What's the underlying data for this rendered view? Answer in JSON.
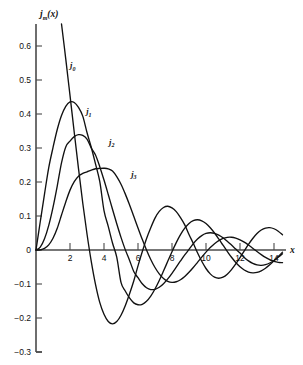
{
  "chart_data": {
    "type": "line",
    "title": "",
    "xlabel": "x",
    "ylabel": "j_m(x)",
    "ylabel_base": "j",
    "ylabel_sub": "m",
    "ylabel_arg": "(x)",
    "xlim": [
      0,
      14.6
    ],
    "ylim": [
      -0.3,
      0.62
    ],
    "grid": false,
    "legend_position": "inline-curve-labels",
    "x_ticks": [
      2,
      4,
      6,
      8,
      10,
      12,
      14
    ],
    "x_tick_labels": [
      "2",
      "4",
      "6",
      "8",
      "10",
      "12",
      "14"
    ],
    "y_ticks": [
      0.6,
      0.5,
      0.4,
      0.3,
      0.2,
      0.1,
      0,
      -0.1,
      -0.2,
      -0.3
    ],
    "y_tick_labels": [
      "0.6",
      "0.5",
      "0.4",
      "0.3",
      "0.2",
      "0.1",
      "0",
      "-0.1",
      "-0.2",
      "-0.3"
    ],
    "annotations": [
      {
        "text": "j0",
        "base": "j",
        "sub": "0",
        "x": 2.0,
        "y": 0.535
      },
      {
        "text": "j1",
        "base": "j",
        "sub": "1",
        "x": 2.95,
        "y": 0.4
      },
      {
        "text": "j2",
        "base": "j",
        "sub": "2",
        "x": 4.3,
        "y": 0.31
      },
      {
        "text": "j3",
        "base": "j",
        "sub": "3",
        "x": 5.6,
        "y": 0.215
      }
    ],
    "series": [
      {
        "name": "j0",
        "label": "j_0(x)",
        "description": "Spherical Bessel function of order 0, sin(x)/x",
        "x": [
          0.0,
          0.25,
          0.5,
          0.75,
          1.0,
          1.25,
          1.5,
          1.75,
          2.0,
          2.25,
          2.5,
          2.75,
          3.0,
          3.25,
          3.5,
          3.75,
          4.0,
          4.25,
          4.5,
          4.75,
          5.0,
          5.25,
          5.5,
          5.75,
          6.0,
          6.25,
          6.5,
          6.75,
          7.0,
          7.25,
          7.5,
          7.75,
          8.0,
          8.25,
          8.5,
          8.75,
          9.0,
          9.25,
          9.5,
          9.75,
          10.0,
          10.25,
          10.5,
          10.75,
          11.0,
          11.25,
          11.5,
          11.75,
          12.0,
          12.25,
          12.5,
          12.75,
          13.0,
          13.25,
          13.5,
          13.75,
          14.0,
          14.25,
          14.5
        ],
        "y": [
          1.0,
          0.9896,
          0.9589,
          0.9089,
          0.8415,
          0.7592,
          0.665,
          0.5623,
          0.4546,
          0.3457,
          0.2392,
          0.1382,
          0.047,
          -0.0334,
          -0.101,
          -0.1541,
          -0.1892,
          -0.2103,
          -0.2172,
          -0.2104,
          -0.1918,
          -0.1638,
          -0.1293,
          -0.0913,
          -0.0466,
          -0.0053,
          0.0331,
          0.0655,
          0.0939,
          0.1134,
          0.1251,
          0.1288,
          0.1237,
          0.1129,
          0.0953,
          0.074,
          0.0458,
          0.0196,
          -0.008,
          -0.0332,
          -0.0544,
          -0.0703,
          -0.08,
          -0.083,
          -0.08,
          -0.0711,
          -0.0576,
          -0.0408,
          -0.0222,
          -0.0026,
          0.0167,
          0.0339,
          0.0484,
          0.0588,
          0.0646,
          0.0658,
          0.0625,
          0.0553,
          0.0446
        ]
      },
      {
        "name": "j1",
        "label": "j_1(x)",
        "description": "Spherical Bessel function of order 1, sin(x)/x^2 - cos(x)/x",
        "peak_value": 0.435,
        "peak_x": 2.08,
        "x": [
          0.0,
          0.25,
          0.5,
          0.75,
          1.0,
          1.25,
          1.5,
          1.75,
          2.0,
          2.25,
          2.5,
          2.75,
          3.0,
          3.25,
          3.5,
          3.75,
          4.0,
          4.25,
          4.5,
          4.75,
          5.0,
          5.25,
          5.5,
          5.75,
          6.0,
          6.25,
          6.5,
          6.75,
          7.0,
          7.25,
          7.5,
          7.75,
          8.0,
          8.25,
          8.5,
          8.75,
          9.0,
          9.25,
          9.5,
          9.75,
          10.0,
          10.25,
          10.5,
          10.75,
          11.0,
          11.25,
          11.5,
          11.75,
          12.0,
          12.25,
          12.5,
          12.75,
          13.0,
          13.25,
          13.5,
          13.75,
          14.0,
          14.25,
          14.5
        ],
        "y": [
          0.0,
          0.0831,
          0.1646,
          0.2423,
          0.3012,
          0.3545,
          0.3957,
          0.4227,
          0.4354,
          0.4339,
          0.4194,
          0.3937,
          0.3457,
          0.3022,
          0.2531,
          0.2015,
          0.1161,
          0.0695,
          0.0207,
          -0.021,
          -0.0951,
          -0.1206,
          -0.1411,
          -0.1556,
          -0.161,
          -0.1596,
          -0.1507,
          -0.1354,
          -0.1146,
          -0.0896,
          -0.062,
          -0.0333,
          -0.0049,
          0.0217,
          0.0451,
          0.0641,
          0.0781,
          0.0864,
          0.0889,
          0.0858,
          0.0779,
          0.0655,
          0.0501,
          0.0326,
          0.0142,
          -0.0041,
          -0.0214,
          -0.0367,
          -0.0494,
          -0.0589,
          -0.0648,
          -0.0671,
          -0.066,
          -0.0613,
          -0.0536,
          -0.0437,
          -0.032,
          -0.0193,
          -0.0063
        ]
      },
      {
        "name": "j2",
        "label": "j_2(x)",
        "description": "Spherical Bessel function of order 2",
        "peak_value": 0.3001,
        "peak_x": 3.34,
        "x": [
          0.0,
          0.25,
          0.5,
          0.75,
          1.0,
          1.25,
          1.5,
          1.75,
          2.0,
          2.25,
          2.5,
          2.75,
          3.0,
          3.25,
          3.5,
          3.75,
          4.0,
          4.25,
          4.5,
          4.75,
          5.0,
          5.25,
          5.5,
          5.75,
          6.0,
          6.25,
          6.5,
          6.75,
          7.0,
          7.25,
          7.5,
          7.75,
          8.0,
          8.25,
          8.5,
          8.75,
          9.0,
          9.25,
          9.5,
          9.75,
          10.0,
          10.25,
          10.5,
          10.75,
          11.0,
          11.25,
          11.5,
          11.75,
          12.0,
          12.25,
          12.5,
          12.75,
          13.0,
          13.25,
          13.5,
          13.75,
          14.0,
          14.25,
          14.5
        ],
        "y": [
          0.0,
          0.0083,
          0.0329,
          0.0726,
          0.1254,
          0.1882,
          0.2563,
          0.3033,
          0.3204,
          0.3335,
          0.3392,
          0.337,
          0.3263,
          0.3001,
          0.2794,
          0.2451,
          0.2057,
          0.1633,
          0.1198,
          0.0772,
          0.0372,
          0.0011,
          -0.0298,
          -0.0631,
          -0.0816,
          -0.0994,
          -0.111,
          -0.1163,
          -0.1157,
          -0.1097,
          -0.0992,
          -0.0851,
          -0.0685,
          -0.0506,
          -0.0323,
          -0.0146,
          0.0016,
          0.0184,
          0.0322,
          0.0424,
          0.0486,
          0.0508,
          0.0491,
          0.044,
          0.036,
          0.0259,
          0.0145,
          0.0027,
          -0.009,
          -0.0217,
          -0.0321,
          -0.0395,
          -0.0439,
          -0.0451,
          -0.0431,
          -0.0382,
          -0.0308,
          -0.0216,
          -0.0112
        ]
      },
      {
        "name": "j3",
        "label": "j_3(x)",
        "description": "Spherical Bessel function of order 3",
        "peak_value": 0.2404,
        "peak_x": 4.51,
        "x": [
          0.0,
          0.25,
          0.5,
          0.75,
          1.0,
          1.25,
          1.5,
          1.75,
          2.0,
          2.25,
          2.5,
          2.75,
          3.0,
          3.25,
          3.5,
          3.75,
          4.0,
          4.25,
          4.5,
          4.75,
          5.0,
          5.25,
          5.5,
          5.75,
          6.0,
          6.25,
          6.5,
          6.75,
          7.0,
          7.25,
          7.5,
          7.75,
          8.0,
          8.25,
          8.5,
          8.75,
          9.0,
          9.25,
          9.5,
          9.75,
          10.0,
          10.25,
          10.5,
          10.75,
          11.0,
          11.25,
          11.5,
          11.75,
          12.0,
          12.25,
          12.5,
          12.75,
          13.0,
          13.25,
          13.5,
          13.75,
          14.0,
          14.25,
          14.5
        ],
        "y": [
          0.0,
          0.0006,
          0.0047,
          0.0152,
          0.0346,
          0.064,
          0.1028,
          0.1411,
          0.1761,
          0.2011,
          0.2171,
          0.2252,
          0.23,
          0.235,
          0.2389,
          0.24,
          0.2404,
          0.2389,
          0.2324,
          0.2159,
          0.1935,
          0.1651,
          0.1331,
          0.0991,
          0.0647,
          0.0313,
          0.0001,
          -0.0278,
          -0.0515,
          -0.0703,
          -0.0839,
          -0.0921,
          -0.0952,
          -0.0934,
          -0.0874,
          -0.0778,
          -0.0655,
          -0.0513,
          -0.0362,
          -0.0209,
          -0.0063,
          0.0071,
          0.0186,
          0.0277,
          0.034,
          0.0373,
          0.0376,
          0.0351,
          0.0301,
          0.0231,
          0.0146,
          0.0053,
          -0.0043,
          -0.0135,
          -0.0218,
          -0.0286,
          -0.0336,
          -0.0365,
          -0.0372
        ]
      }
    ]
  }
}
